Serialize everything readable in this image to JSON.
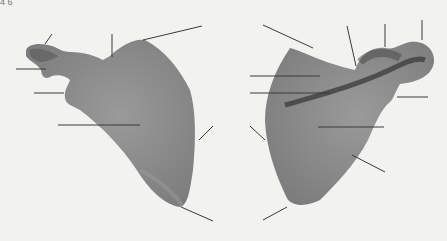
{
  "figure": {
    "label": "4 6",
    "colors": {
      "background": "#f2f2f0",
      "bone": "#8f8f8f",
      "bone_dark": "#4a4a4a",
      "line": "#3a3a3a"
    },
    "views": [
      {
        "name": "anterior-view",
        "leader_line_count": 8
      },
      {
        "name": "posterior-view",
        "leader_line_count": 9
      }
    ]
  }
}
